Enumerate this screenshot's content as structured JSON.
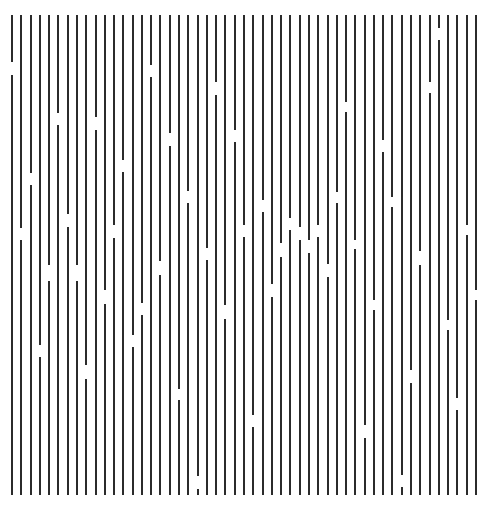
{
  "figure": {
    "type": "line-grating-stimulus",
    "background_color": "#ffffff",
    "line_color": "#2b2b2b",
    "line_count": 51,
    "line_width_px": 2,
    "first_line_x": 12,
    "line_spacing_px": 9.28,
    "top_y": 15,
    "bottom_y": 495,
    "gaps": [
      {
        "line": 0,
        "y0": 62,
        "y1": 75
      },
      {
        "line": 1,
        "y0": 228,
        "y1": 240
      },
      {
        "line": 2,
        "y0": 173,
        "y1": 185
      },
      {
        "line": 3,
        "y0": 345,
        "y1": 357
      },
      {
        "line": 4,
        "y0": 265,
        "y1": 281
      },
      {
        "line": 5,
        "y0": 113,
        "y1": 125
      },
      {
        "line": 6,
        "y0": 214,
        "y1": 227
      },
      {
        "line": 7,
        "y0": 265,
        "y1": 281
      },
      {
        "line": 8,
        "y0": 365,
        "y1": 379
      },
      {
        "line": 9,
        "y0": 117,
        "y1": 130
      },
      {
        "line": 10,
        "y0": 290,
        "y1": 304
      },
      {
        "line": 11,
        "y0": 225,
        "y1": 238
      },
      {
        "line": 12,
        "y0": 160,
        "y1": 172
      },
      {
        "line": 13,
        "y0": 335,
        "y1": 347
      },
      {
        "line": 14,
        "y0": 303,
        "y1": 315
      },
      {
        "line": 15,
        "y0": 65,
        "y1": 77
      },
      {
        "line": 16,
        "y0": 261,
        "y1": 275
      },
      {
        "line": 17,
        "y0": 133,
        "y1": 146
      },
      {
        "line": 18,
        "y0": 389,
        "y1": 400
      },
      {
        "line": 19,
        "y0": 191,
        "y1": 203
      },
      {
        "line": 20,
        "y0": 476,
        "y1": 489
      },
      {
        "line": 21,
        "y0": 248,
        "y1": 260
      },
      {
        "line": 22,
        "y0": 82,
        "y1": 95
      },
      {
        "line": 23,
        "y0": 305,
        "y1": 319
      },
      {
        "line": 24,
        "y0": 130,
        "y1": 142
      },
      {
        "line": 25,
        "y0": 225,
        "y1": 237
      },
      {
        "line": 26,
        "y0": 415,
        "y1": 427
      },
      {
        "line": 27,
        "y0": 200,
        "y1": 212
      },
      {
        "line": 28,
        "y0": 284,
        "y1": 297
      },
      {
        "line": 29,
        "y0": 243,
        "y1": 257
      },
      {
        "line": 30,
        "y0": 218,
        "y1": 230
      },
      {
        "line": 31,
        "y0": 227,
        "y1": 240
      },
      {
        "line": 32,
        "y0": 240,
        "y1": 253
      },
      {
        "line": 33,
        "y0": 225,
        "y1": 237
      },
      {
        "line": 34,
        "y0": 264,
        "y1": 277
      },
      {
        "line": 35,
        "y0": 192,
        "y1": 203
      },
      {
        "line": 36,
        "y0": 102,
        "y1": 112
      },
      {
        "line": 37,
        "y0": 240,
        "y1": 249
      },
      {
        "line": 38,
        "y0": 425,
        "y1": 438
      },
      {
        "line": 39,
        "y0": 300,
        "y1": 310
      },
      {
        "line": 40,
        "y0": 140,
        "y1": 152
      },
      {
        "line": 41,
        "y0": 197,
        "y1": 207
      },
      {
        "line": 42,
        "y0": 475,
        "y1": 487
      },
      {
        "line": 43,
        "y0": 370,
        "y1": 383
      },
      {
        "line": 44,
        "y0": 251,
        "y1": 265
      },
      {
        "line": 45,
        "y0": 82,
        "y1": 93
      },
      {
        "line": 46,
        "y0": 28,
        "y1": 40
      },
      {
        "line": 47,
        "y0": 320,
        "y1": 330
      },
      {
        "line": 48,
        "y0": 398,
        "y1": 410
      },
      {
        "line": 49,
        "y0": 225,
        "y1": 235
      },
      {
        "line": 50,
        "y0": 290,
        "y1": 300
      }
    ]
  }
}
